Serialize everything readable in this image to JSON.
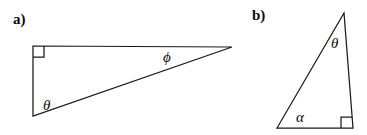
{
  "figure": {
    "background_color": "#ffffff",
    "stroke_color": "#1a1a1a",
    "panels": [
      {
        "id": "a",
        "label": "a)",
        "description": "right triangle with right angle at upper-left vertex",
        "vertices": {
          "top_left": [
            33,
            46
          ],
          "bottom_left": [
            33,
            116
          ],
          "right": [
            232,
            47
          ]
        },
        "right_angle_marker": {
          "at_vertex": "top_left",
          "size": 11
        },
        "angle_labels": [
          {
            "name": "theta",
            "glyph": "θ",
            "at_vertex": "bottom_left",
            "x": 48,
            "y": 105
          },
          {
            "name": "phi",
            "glyph": "ϕ",
            "at_vertex": "right",
            "x": 169,
            "y": 57
          }
        ]
      },
      {
        "id": "b",
        "label": "b)",
        "description": "right triangle with right angle at lower-right vertex",
        "vertices": {
          "top_right": [
            344,
            13
          ],
          "bottom_right": [
            353,
            128
          ],
          "bottom_left": [
            277,
            128
          ]
        },
        "right_angle_marker": {
          "at_vertex": "bottom_right",
          "size": 11
        },
        "angle_labels": [
          {
            "name": "theta",
            "glyph": "θ",
            "at_vertex": "top_right",
            "x": 336,
            "y": 43
          },
          {
            "name": "alpha",
            "glyph": "α",
            "at_vertex": "bottom_left",
            "x": 301,
            "y": 117
          }
        ]
      }
    ]
  },
  "labels": {
    "panel_a": "a)",
    "panel_b": "b)",
    "theta_a": "θ",
    "phi_a": "ϕ",
    "theta_b": "θ",
    "alpha_b": "α"
  }
}
